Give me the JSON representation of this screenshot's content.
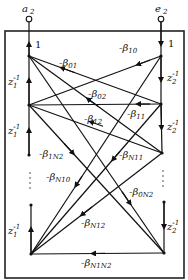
{
  "diagram": {
    "type": "signal-flow-graph",
    "terminals": {
      "input_label": "a",
      "input_sub": "2",
      "output_label": "e",
      "output_sub": "2"
    },
    "gains": {
      "input_gain": "1",
      "output_gain": "1"
    },
    "delays": {
      "left": {
        "base": "z",
        "sub": "1",
        "sup": "-1"
      },
      "right": {
        "base": "z",
        "sub": "2",
        "sup": "-1"
      }
    },
    "ellipsis": ":",
    "edges": [
      {
        "id": "b01",
        "label": "-β",
        "sub": "01"
      },
      {
        "id": "b10",
        "label": "-β",
        "sub": "10"
      },
      {
        "id": "b02",
        "label": "-β",
        "sub": "02"
      },
      {
        "id": "b11",
        "label": "-β",
        "sub": "11"
      },
      {
        "id": "b12",
        "label": "-β",
        "sub": "12"
      },
      {
        "id": "b1N2",
        "label": "-β",
        "sub": "1N2"
      },
      {
        "id": "bN11",
        "label": "-β",
        "sub": "N11"
      },
      {
        "id": "bN10",
        "label": "-β",
        "sub": "N10"
      },
      {
        "id": "b0N2",
        "label": "-β",
        "sub": "0N2"
      },
      {
        "id": "bN12",
        "label": "-β",
        "sub": "N12"
      },
      {
        "id": "bN1N2",
        "label": "-β",
        "sub": "N1N2"
      }
    ]
  }
}
